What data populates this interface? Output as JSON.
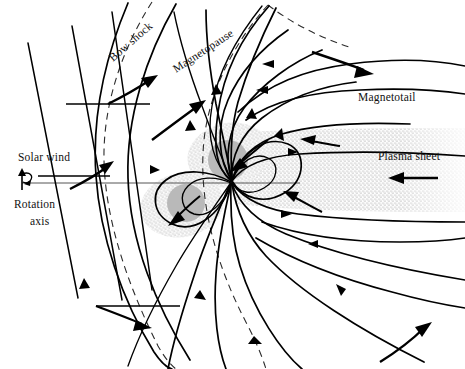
{
  "figure": {
    "background_color": "#ffffff",
    "width": 465,
    "height": 369
  },
  "labels": {
    "bow_shock": "Bow shock",
    "magnetopause": "Magnetopause",
    "magnetotail": "Magnetotail",
    "plasma_sheet": "Plasma sheet",
    "solar_wind": "Solar wind",
    "rotation_axis_line1": "Rotation",
    "rotation_axis_line2": "axis"
  },
  "colors": {
    "ink": "#000000",
    "boundary_dash": "#2b2b2b",
    "axis": "#555555",
    "belt_core": "#b9b9b9",
    "stipple": "#8a8a8a",
    "background": "#ffffff"
  },
  "diagram_elements": {
    "interplanetary_field_lines": 3,
    "bow_shock_style": "dashed curve",
    "magnetopause_style": "dashed curve",
    "closed_dayside_field_lines": 7,
    "magnetotail_field_lines_north": 3,
    "magnetotail_field_lines_south": 3,
    "radiation_belt_lobes": 2,
    "plasma_sheet_style": "stippled horizontal band",
    "flow_arrow_count": 11
  }
}
